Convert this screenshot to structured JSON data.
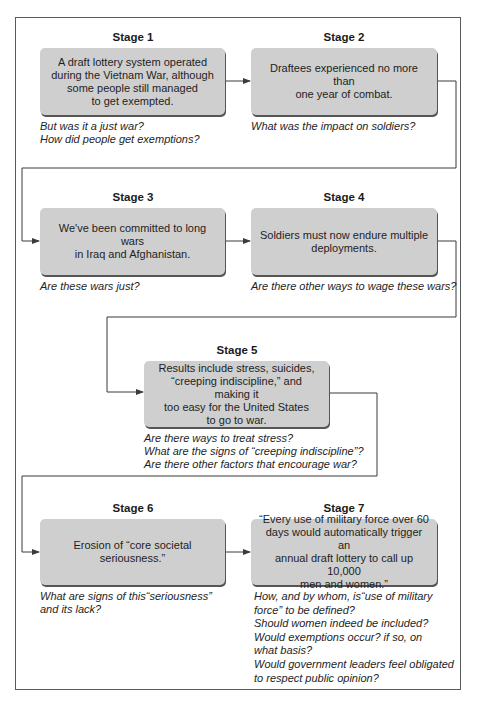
{
  "stages": [
    {
      "title": "Stage 1",
      "text": "A draft lottery system operated\nduring the Vietnam War, although\nsome people still managed\nto get exempted.",
      "questions": "But was it a just war?\nHow did people get exemptions?"
    },
    {
      "title": "Stage 2",
      "text": "Draftees experienced no more than\none year of combat.",
      "questions": "What was the impact on soldiers?"
    },
    {
      "title": "Stage 3",
      "text": "We've been committed to long wars\nin Iraq and Afghanistan.",
      "questions": "Are these wars just?"
    },
    {
      "title": "Stage 4",
      "text": "Soldiers must now endure multiple\ndeployments.",
      "questions": "Are there other ways to wage these wars?"
    },
    {
      "title": "Stage 5",
      "text": "Results include stress, suicides,\n“creeping indiscipline,” and making it\ntoo easy for the United States\nto go to war.",
      "questions": "Are there ways to treat stress?\nWhat are the signs of “creeping indiscipline”?\nAre there other factors that encourage war?"
    },
    {
      "title": "Stage 6",
      "text": "Erosion of “core societal seriousness.”",
      "questions": "What are signs of this“seriousness”\nand its lack?"
    },
    {
      "title": "Stage 7",
      "text": "“Every use of military force over 60\ndays would automatically trigger an\nannual draft lottery to call up 10,000\nmen and women.”",
      "questions": "How, and by whom, is“use of military\nforce” to be defined?\nShould women indeed be included?\nWould exemptions occur? if so, on\nwhat basis?\nWould government leaders feel obligated\nto respect public opinion?"
    }
  ],
  "colors": {
    "box_fill": "#cfcfcf",
    "box_shadow": "#555555",
    "line": "#3a3a3a",
    "frame": "#5a5a5a"
  }
}
